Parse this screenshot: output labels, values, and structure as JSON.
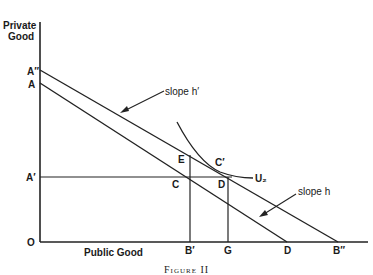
{
  "axes": {
    "y_label_line1": "Private",
    "y_label_line2": "Good",
    "x_label": "Public Good",
    "origin": "O"
  },
  "points": {
    "A_double_prime": "A″",
    "A": "A",
    "A_prime": "A′",
    "E": "E",
    "C": "C",
    "C_prime": "C′",
    "D_upper": "D",
    "B_prime": "B′",
    "G": "G",
    "D_axis": "D",
    "B_double_prime": "B″"
  },
  "curves": {
    "indifference": "U₂"
  },
  "annotations": {
    "slope_h_prime": "slope h′",
    "slope_h": "slope h"
  },
  "caption": "Figure II"
}
